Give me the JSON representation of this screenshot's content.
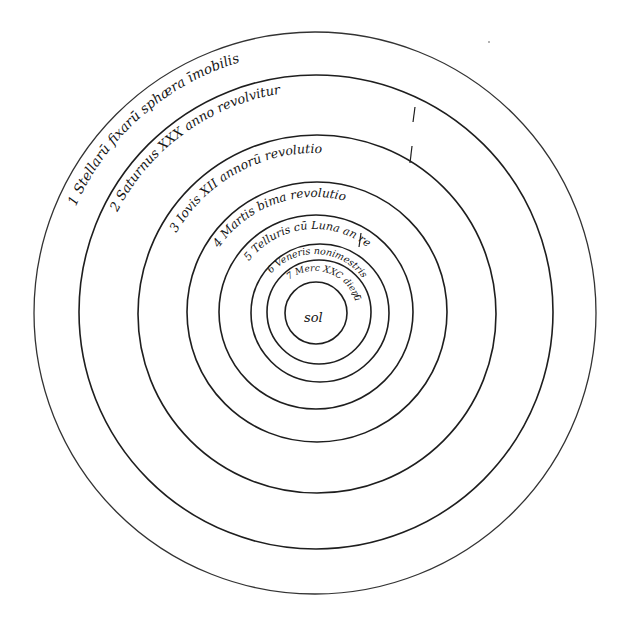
{
  "colors": {
    "ink": "#151515",
    "paper": "#ffffff",
    "orbit": "#1e1e1e"
  },
  "center": {
    "x": 315,
    "y": 313
  },
  "spheres": [
    {
      "id": "stars",
      "number": "1",
      "label": "1 Stellarū fixarū sphæra īmobilis",
      "radius": 281,
      "text_radius": 262,
      "font_size": 13.5,
      "start_deg": 204,
      "end_deg": 330
    },
    {
      "id": "saturn",
      "number": "2",
      "label": "2 Saturnus XXX anno revolvitur",
      "radius": 237,
      "text_radius": 222,
      "font_size": 13,
      "start_deg": 207,
      "end_deg": 328
    },
    {
      "id": "jupiter",
      "number": "3",
      "label": "3 Iovis XII annorū revolutio",
      "radius": 179,
      "text_radius": 160,
      "font_size": 12.5,
      "start_deg": 210,
      "end_deg": 325
    },
    {
      "id": "mars",
      "number": "4",
      "label": "4 Martis bima revolutio",
      "radius": 130,
      "text_radius": 116,
      "font_size": 12,
      "start_deg": 214,
      "end_deg": 330
    },
    {
      "id": "earth",
      "number": "5",
      "label": "5 Telluris cū Luna an re",
      "radius": 97,
      "text_radius": 84,
      "font_size": 11,
      "start_deg": 218,
      "end_deg": 348
    },
    {
      "id": "venus",
      "number": "6",
      "label": "6 Veneris nonimestris",
      "radius": 69,
      "text_radius": 59,
      "font_size": 9.5,
      "start_deg": 222,
      "end_deg": 360
    },
    {
      "id": "mercury",
      "number": "7",
      "label": "7 Merc XXC dierū",
      "radius": 52,
      "text_radius": 42,
      "font_size": 9,
      "start_deg": 232,
      "end_deg": 368
    },
    {
      "id": "sun",
      "number": "",
      "label": "",
      "radius": 31,
      "text_radius": 0,
      "font_size": 0,
      "start_deg": 0,
      "end_deg": 0
    }
  ],
  "sun": {
    "label": "sol"
  }
}
